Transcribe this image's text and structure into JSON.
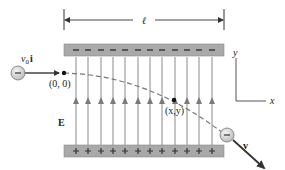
{
  "diagram": {
    "type": "physics-diagram",
    "labels": {
      "length": "ℓ",
      "initial_velocity_v": "v",
      "initial_velocity_sub": "0",
      "initial_velocity_unit": "i",
      "origin": "(0, 0)",
      "point": "(x,y)",
      "field": "E",
      "final_velocity": "v",
      "axis_x": "x",
      "axis_y": "y"
    },
    "top_plate": {
      "charge_sign": "−",
      "sign_count": 12,
      "color": "#a9a9a9"
    },
    "bottom_plate": {
      "charge_sign": "+",
      "sign_count": 12,
      "color": "#a9a9a9"
    },
    "field_lines": {
      "count": 12,
      "direction": "up",
      "color": "#8a8a8a"
    },
    "particle": {
      "charge_label": "−",
      "fill": "#d9d9d9",
      "stroke": "#777777"
    },
    "trajectory": {
      "style": "dashed",
      "color": "#777777"
    }
  }
}
